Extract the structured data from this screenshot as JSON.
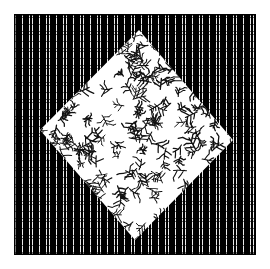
{
  "image": {
    "title": "Two-tone textile swatch composite",
    "width": 270,
    "height": 269,
    "background_color": "#ffffff",
    "description": "A square of dark woven grid fabric with a white diamond of twig-print fabric laid diagonally on top of it."
  },
  "outer_square": {
    "name": "dark grid fabric square",
    "fill_color": "#000000",
    "dot_color": "#ffffff",
    "left": 14,
    "top": 14,
    "width": 242,
    "height": 241,
    "pattern": "fine woven grid mesh, white dots on black, about 3 px period"
  },
  "inner_diamond": {
    "name": "white twig-print diamond",
    "fill_color": "#ffffff",
    "motif_color": "#111111",
    "pattern": "scattered branching twig sprigs",
    "motif_count": 260,
    "vertices": {
      "top": [
        139,
        30
      ],
      "right": [
        233,
        140
      ],
      "bottom": [
        135,
        240
      ],
      "left": [
        40,
        130
      ]
    }
  },
  "chart_data": {
    "type": "scatter",
    "xlabel": "",
    "ylabel": "",
    "xlim": [
      0,
      270
    ],
    "ylim": [
      0,
      269
    ],
    "grid": false,
    "legend": "none",
    "series": [
      {
        "name": "dark grid fabric square",
        "shape": "rectangle",
        "color": "#000000",
        "points": [
          [
            14,
            14
          ],
          [
            256,
            14
          ],
          [
            256,
            255
          ],
          [
            14,
            255
          ]
        ]
      },
      {
        "name": "white twig-print diamond",
        "shape": "quadrilateral",
        "color": "#ffffff",
        "points": [
          [
            139,
            30
          ],
          [
            233,
            140
          ],
          [
            135,
            240
          ],
          [
            40,
            130
          ]
        ]
      }
    ]
  }
}
